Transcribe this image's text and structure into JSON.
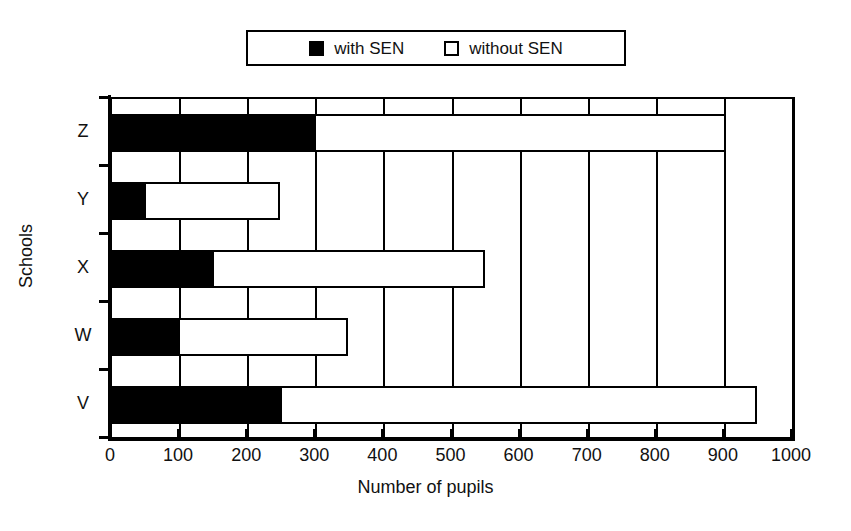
{
  "chart_data": {
    "type": "bar",
    "orientation": "horizontal",
    "stacked": true,
    "title": "",
    "xlabel": "Number of pupils",
    "ylabel": "Schools",
    "xlim": [
      0,
      1000
    ],
    "xticks": [
      0,
      100,
      200,
      300,
      400,
      500,
      600,
      700,
      800,
      900,
      1000
    ],
    "xtick_labels": [
      "0",
      "100",
      "200",
      "300",
      "400",
      "500",
      "600",
      "700",
      "800",
      "900",
      "1000"
    ],
    "grid": "vertical",
    "categories": [
      "V",
      "W",
      "X",
      "Y",
      "Z"
    ],
    "categories_top_to_bottom": [
      "Z",
      "Y",
      "X",
      "W",
      "V"
    ],
    "legend_position": "top-center",
    "series": [
      {
        "name": "with SEN",
        "color": "#000000",
        "values": [
          250,
          100,
          150,
          50,
          300
        ]
      },
      {
        "name": "without SEN",
        "color": "#ffffff",
        "values": [
          700,
          250,
          400,
          200,
          605
        ]
      }
    ],
    "totals": [
      950,
      350,
      550,
      250,
      905
    ],
    "rows_top_to_bottom": [
      {
        "category": "Z",
        "with_sen": 300,
        "total": 905,
        "without_sen": 605
      },
      {
        "category": "Y",
        "with_sen": 50,
        "total": 250,
        "without_sen": 200
      },
      {
        "category": "X",
        "with_sen": 150,
        "total": 550,
        "without_sen": 400
      },
      {
        "category": "W",
        "with_sen": 100,
        "total": 350,
        "without_sen": 250
      },
      {
        "category": "V",
        "with_sen": 250,
        "total": 950,
        "without_sen": 700
      }
    ]
  },
  "legend": {
    "items": [
      {
        "label": "with SEN",
        "swatch": "filled-square-icon"
      },
      {
        "label": "without SEN",
        "swatch": "hollow-square-icon"
      }
    ]
  },
  "axes": {
    "x_title": "Number of pupils",
    "y_title": "Schools"
  },
  "colors": {
    "ink": "#000000",
    "paper": "#ffffff"
  }
}
